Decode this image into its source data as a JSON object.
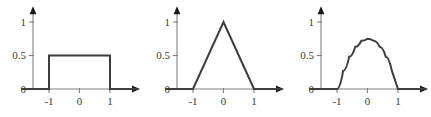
{
  "figure": {
    "background_color": "#ffffff",
    "axis_color": "#808080",
    "curve_color": "#3d3d3d",
    "label_color": "#3a3a3a"
  },
  "chart_data": [
    {
      "type": "line",
      "title": "",
      "name": "uniform-kernel",
      "xlabel": "",
      "ylabel": "",
      "xlim": [
        -1.9,
        1.95
      ],
      "ylim": [
        0,
        1.22
      ],
      "xticks": [
        -1,
        0,
        1
      ],
      "xticklabels": [
        "-1",
        "0",
        "1"
      ],
      "yticks": [
        0,
        0.5,
        1
      ],
      "yticklabels": [
        "0",
        "0.5",
        "1"
      ],
      "grid": false,
      "legend": "none",
      "x": [
        -1.9,
        -1.0,
        -1.0,
        1.0,
        1.0,
        1.9
      ],
      "y": [
        0,
        0,
        0.5,
        0.5,
        0,
        0
      ]
    },
    {
      "type": "line",
      "title": "",
      "name": "triangular-kernel",
      "xlabel": "",
      "ylabel": "",
      "xlim": [
        -1.9,
        1.95
      ],
      "ylim": [
        0,
        1.22
      ],
      "xticks": [
        -1,
        0,
        1
      ],
      "xticklabels": [
        "-1",
        "0",
        "1"
      ],
      "yticks": [
        0,
        0.5,
        1
      ],
      "yticklabels": [
        "0",
        "0.5",
        "1"
      ],
      "grid": false,
      "legend": "none",
      "x": [
        -1.9,
        -1.0,
        0.0,
        1.0,
        1.9
      ],
      "y": [
        0,
        0,
        1.0,
        0,
        0
      ]
    },
    {
      "type": "line",
      "title": "",
      "name": "epanechnikov-kernel",
      "xlabel": "",
      "ylabel": "",
      "xlim": [
        -1.9,
        1.95
      ],
      "ylim": [
        0,
        1.22
      ],
      "xticks": [
        -1,
        0,
        1
      ],
      "xticklabels": [
        "-1",
        "0",
        "1"
      ],
      "yticks": [
        0,
        0.5,
        1
      ],
      "yticklabels": [
        "0",
        "0.5",
        "1"
      ],
      "grid": false,
      "legend": "none",
      "x": [
        -1.9,
        -1.0,
        -0.8,
        -0.6,
        -0.4,
        -0.2,
        0.0,
        0.2,
        0.4,
        0.6,
        0.8,
        1.0,
        1.9
      ],
      "y": [
        0,
        0,
        0.27,
        0.48,
        0.63,
        0.72,
        0.75,
        0.72,
        0.63,
        0.48,
        0.27,
        0,
        0
      ]
    }
  ]
}
